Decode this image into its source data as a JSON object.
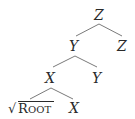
{
  "tree": {
    "nodes": [
      {
        "id": "n1",
        "label": "Z",
        "level": 0
      },
      {
        "id": "n2",
        "label": "Y",
        "level": 1
      },
      {
        "id": "n3",
        "label": "Z",
        "level": 1
      },
      {
        "id": "n4",
        "label": "X",
        "level": 2
      },
      {
        "id": "n5",
        "label": "Y",
        "level": 2
      },
      {
        "id": "n6",
        "label": "√Root",
        "root_sign": "√",
        "root_first": "R",
        "root_rest": "OOT",
        "level": 3
      },
      {
        "id": "n7",
        "label": "X",
        "level": 3
      }
    ],
    "edges": [
      [
        "n1",
        "n2"
      ],
      [
        "n1",
        "n3"
      ],
      [
        "n2",
        "n4"
      ],
      [
        "n2",
        "n5"
      ],
      [
        "n4",
        "n6"
      ],
      [
        "n4",
        "n7"
      ]
    ]
  },
  "colors": {
    "text": "#2a2a2a",
    "edge": "#7a7a7a",
    "background": "#ffffff"
  }
}
